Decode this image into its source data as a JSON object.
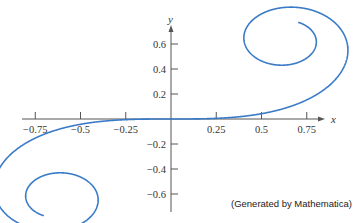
{
  "chart_data": {
    "type": "line",
    "title": "",
    "xlabel": "x",
    "ylabel": "y",
    "xlim": [
      -0.8,
      0.85
    ],
    "ylim": [
      -0.7,
      0.7
    ],
    "x_ticks": [
      -0.75,
      -0.5,
      -0.25,
      0.25,
      0.5,
      0.75
    ],
    "x_tick_labels": [
      "−0.75",
      "−0.5",
      "−0.25",
      "0.25",
      "0.5",
      "0.75"
    ],
    "y_ticks": [
      0.6,
      0.4,
      0.2,
      -0.2,
      -0.4,
      -0.6
    ],
    "y_tick_labels": [
      "0.6",
      "0.4",
      "0.2",
      "−0.2",
      "−0.4",
      "−0.6"
    ],
    "t_range": [
      -3.0,
      3.0
    ],
    "spiral_limits": [
      [
        0.627,
        0.627
      ],
      [
        -0.627,
        -0.627
      ]
    ],
    "grid": false,
    "series": [
      {
        "name": "spiral",
        "color": "#3a7bc8"
      }
    ],
    "annotation": "(Generated by Mathematica)"
  }
}
